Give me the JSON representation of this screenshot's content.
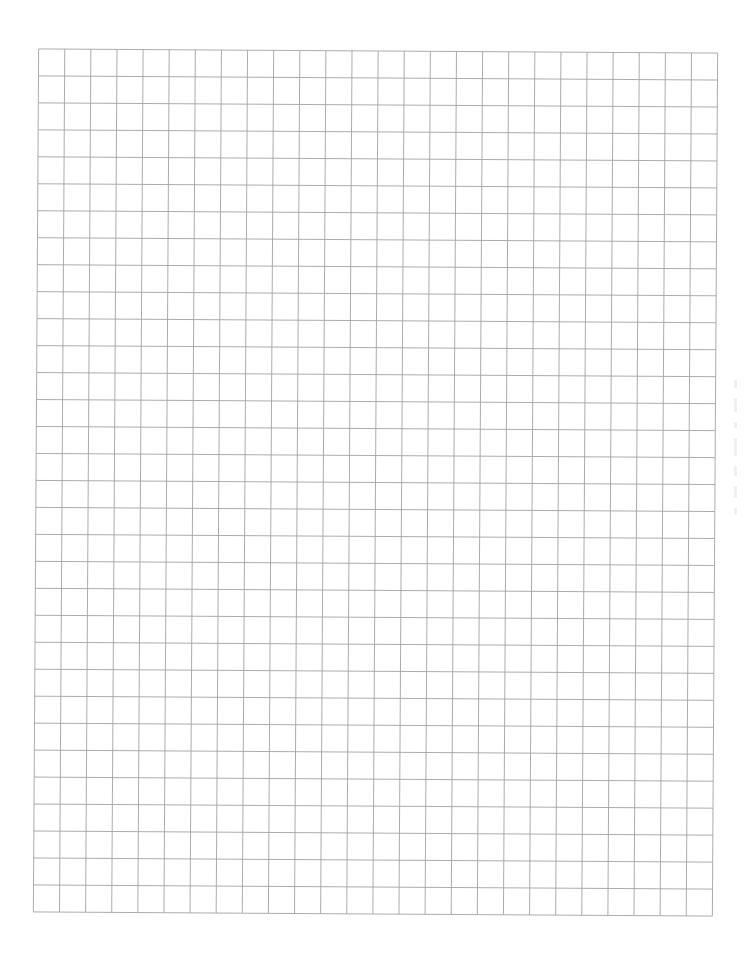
{
  "document": {
    "type": "graph-paper",
    "grid": {
      "columns": 26,
      "rows": 32,
      "cell_width_px": 26.1,
      "cell_height_px": 26.97,
      "line_color": "#a3a3a3",
      "background_color": "#ffffff"
    },
    "margin_marks": {
      "right_margin_bleed_through": true
    }
  }
}
